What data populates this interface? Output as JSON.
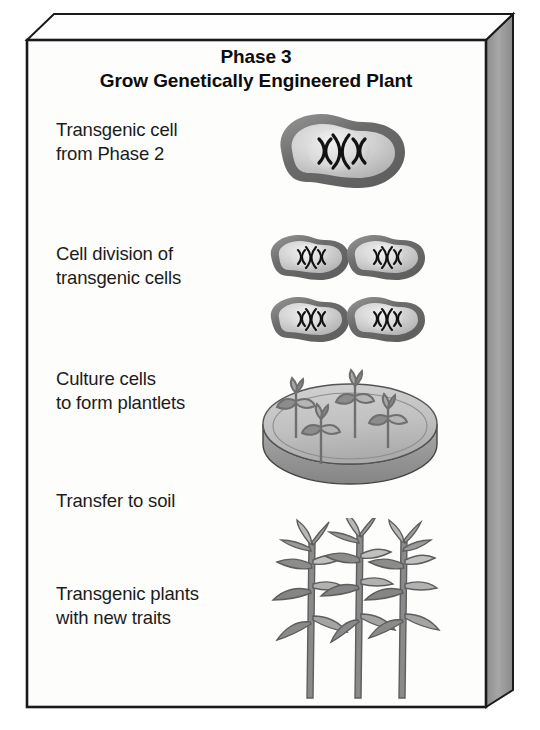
{
  "figure": {
    "title_line1": "Phase 3",
    "title_line2": "Grow Genetically Engineered Plant",
    "frame_style": "3d-beveled-slab",
    "colors": {
      "background": "#ffffff",
      "panel_face": "#fdfdfb",
      "panel_side_shadow": "#9a9a9a",
      "panel_top_bevel": "#ffffff",
      "outline": "#1a1a1a",
      "text": "#1c1c1c",
      "cell_membrane": "#6e6e6e",
      "cell_cytoplasm": "#c9c9c9",
      "cell_nucleus": "#e0e0e0",
      "chromosome": "#141414",
      "dish_rim": "#b3b3b3",
      "dish_medium": "#c4c4c4",
      "dish_wall": "#8f8f8f",
      "plant_leaf": "#8c8c8c",
      "plant_leaf_light": "#bdbdbd",
      "plant_stem": "#7a7a7a"
    },
    "steps": [
      {
        "id": "transgenic-cell",
        "label": "Transgenic cell\nfrom Phase 2",
        "art": "single-transgenic-cell",
        "chromosome_pairs": 3
      },
      {
        "id": "cell-division",
        "label": "Cell division of\ntransgenic cells",
        "art": "four-dividing-cells",
        "cell_count": 4,
        "chromosome_pairs": 3
      },
      {
        "id": "culture-cells",
        "label": "Culture cells\nto form plantlets",
        "art": "petri-dish-with-plantlets",
        "plantlet_count": 4
      },
      {
        "id": "transfer-to-soil",
        "label": "Transfer to soil",
        "art": "none"
      },
      {
        "id": "transgenic-plants",
        "label": "Transgenic plants\nwith new traits",
        "art": "three-mature-plants",
        "plant_count": 3
      }
    ]
  }
}
